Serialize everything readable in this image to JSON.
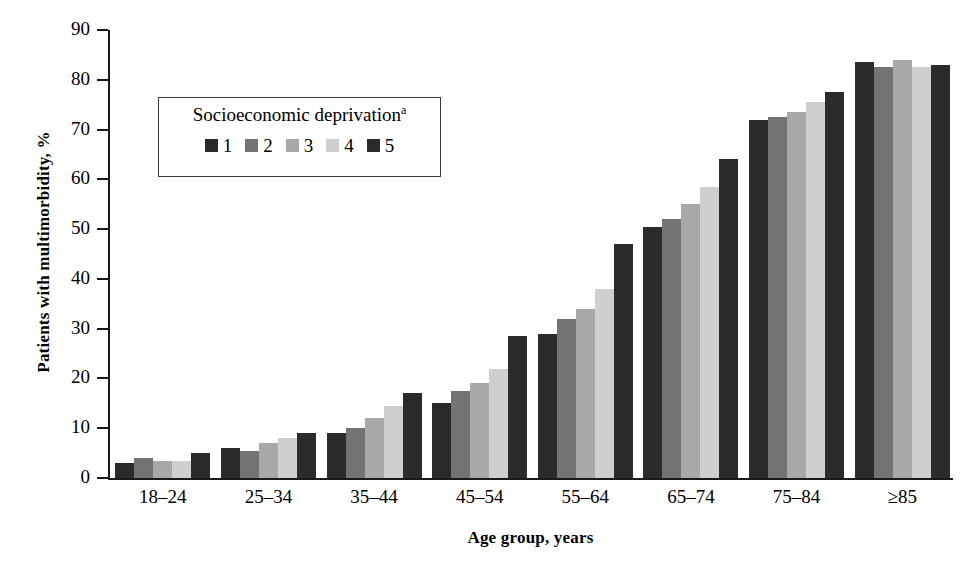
{
  "chart_data": {
    "type": "bar",
    "title": "",
    "xlabel": "Age group, years",
    "ylabel": "Patients with multimorbidity, %",
    "categories": [
      "18–24",
      "25–34",
      "35–44",
      "45–54",
      "55–64",
      "65–74",
      "75–84",
      "≥85"
    ],
    "series": [
      {
        "name": "1",
        "color": "#2b2b2b",
        "values": [
          3.0,
          6.0,
          9.0,
          15.0,
          29.0,
          50.5,
          72.0,
          83.5
        ]
      },
      {
        "name": "2",
        "color": "#737373",
        "values": [
          4.0,
          5.5,
          10.0,
          17.5,
          32.0,
          52.0,
          72.5,
          82.5
        ]
      },
      {
        "name": "3",
        "color": "#a8a8a8",
        "values": [
          3.5,
          7.0,
          12.0,
          19.0,
          34.0,
          55.0,
          73.5,
          84.0
        ]
      },
      {
        "name": "4",
        "color": "#cfcfcf",
        "values": [
          3.5,
          8.0,
          14.5,
          22.0,
          38.0,
          58.5,
          75.5,
          82.5
        ]
      },
      {
        "name": "5",
        "color": "#2b2b2b",
        "values": [
          5.0,
          9.0,
          17.0,
          28.5,
          47.0,
          64.0,
          77.5,
          83.0
        ]
      }
    ],
    "ylim": [
      0,
      90
    ],
    "yticks": [
      0,
      10,
      20,
      30,
      40,
      50,
      60,
      70,
      80,
      90
    ],
    "ytick_labels": [
      "0",
      "10",
      "20",
      "30",
      "40",
      "50",
      "60",
      "70",
      "80",
      "90"
    ],
    "grid": false,
    "legend": {
      "title": "Socioeconomic deprivation",
      "title_superscript": "a",
      "position": "inside-upper-left",
      "entries": [
        "1",
        "2",
        "3",
        "4",
        "5"
      ]
    }
  }
}
